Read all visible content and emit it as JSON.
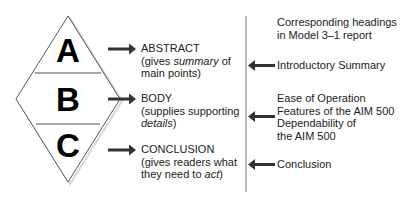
{
  "diagram": {
    "type": "report-structure-mapping",
    "colors": {
      "outline": "#555555",
      "arrow": "#333333",
      "text": "#222222",
      "divider": "#777777"
    },
    "diamond": {
      "sections": [
        {
          "letter": "A"
        },
        {
          "letter": "B"
        },
        {
          "letter": "C"
        }
      ]
    },
    "left_labels": [
      {
        "title": "ABSTRACT",
        "line2_pre": "(gives ",
        "line2_em": "summary",
        "line2_post": " of",
        "line3_pre": "main points)",
        "line3_em": "",
        "line3_post": ""
      },
      {
        "title": "BODY",
        "line2_pre": "(supplies supporting",
        "line2_em": "",
        "line2_post": "",
        "line3_pre": "",
        "line3_em": "details",
        "line3_post": ")"
      },
      {
        "title": "CONCLUSION",
        "line2_pre": "(gives readers what",
        "line2_em": "",
        "line2_post": "",
        "line3_pre": "they need to ",
        "line3_em": "act",
        "line3_post": ")"
      }
    ],
    "right_column": {
      "header_line1": "Corresponding headings",
      "header_line2": "in Model 3–1 report",
      "items": [
        {
          "lines": [
            "Introductory Summary"
          ]
        },
        {
          "lines": [
            "Ease of Operation",
            "Features of the AIM 500",
            "Dependability of",
            "the AIM 500"
          ]
        },
        {
          "lines": [
            "Conclusion"
          ]
        }
      ]
    }
  }
}
